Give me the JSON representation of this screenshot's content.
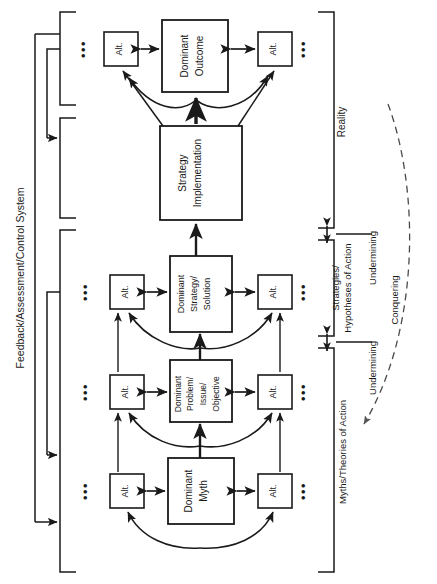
{
  "diagram": {
    "orientation": "rotated-90",
    "colors": {
      "stroke": "#1a1a1a",
      "text": "#1a1a1a",
      "background": "#ffffff"
    }
  },
  "left_label": {
    "text": "Feedback/Assessment/Control System"
  },
  "right_labels": {
    "reality": "Reality",
    "strategies": "Strategies/",
    "strategies2": "Hypotheses of Action",
    "myths": "Myths/Theories of Action",
    "undermining_upper": "Undermining",
    "undermining_lower": "Undermining",
    "conquering": "Conquering"
  },
  "rows": [
    {
      "id": "outcome",
      "center_box": {
        "label_lines": [
          "Dominant",
          "Outcome"
        ]
      },
      "alt_left": {
        "label": "Alt."
      },
      "alt_right": {
        "label": "Alt."
      },
      "ellipsis_left": "•••",
      "ellipsis_right": "•••"
    },
    {
      "id": "strategy-implementation",
      "center_box": {
        "label_lines": [
          "Strategy",
          "Implementation"
        ]
      }
    },
    {
      "id": "strategy",
      "center_box": {
        "label_lines": [
          "Dominant",
          "Strategy/",
          "Solution"
        ]
      },
      "alt_left": {
        "label": "Alt."
      },
      "alt_right": {
        "label": "Alt."
      },
      "ellipsis_left": "•••",
      "ellipsis_right": "•••"
    },
    {
      "id": "problem",
      "center_box": {
        "label_lines": [
          "Dominant",
          "Problem/",
          "Issue/",
          "Objective"
        ]
      },
      "alt_left": {
        "label": "Alt."
      },
      "alt_right": {
        "label": "Alt."
      },
      "ellipsis_left": "•••",
      "ellipsis_right": "•••"
    },
    {
      "id": "myth",
      "center_box": {
        "label_lines": [
          "Dominant",
          "Myth"
        ]
      },
      "alt_left": {
        "label": "Alt."
      },
      "alt_right": {
        "label": "Alt."
      },
      "ellipsis_left": "•••",
      "ellipsis_right": "•••"
    }
  ]
}
